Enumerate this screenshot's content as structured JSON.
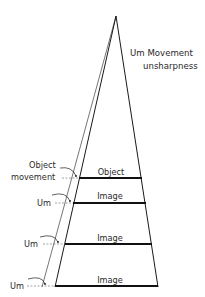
{
  "title": {
    "line1": "Um Movement",
    "line2": "unsharpness"
  },
  "plane_labels": {
    "object": "Object",
    "image1": "Image",
    "image2": "Image",
    "image3": "Image"
  },
  "side_labels": {
    "object_movement_1": "Object",
    "object_movement_2": "movement",
    "um1": "Um",
    "um2": "Um",
    "um3": "Um"
  },
  "colors": {
    "line": "#1a1a1a",
    "text": "#2a2a2a",
    "background": "#ffffff"
  }
}
